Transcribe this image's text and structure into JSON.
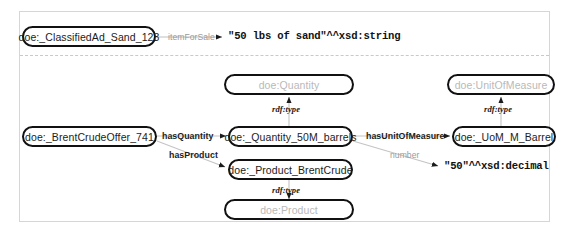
{
  "diagram": {
    "type": "rdf-graph",
    "nodes": {
      "classified_ad": "doe:_ClassifiedAd_Sand_123",
      "quantity_class": "doe:Quantity",
      "unit_of_measure_class": "doe:UnitOfMeasure",
      "brent_crude_offer": "doe:_BrentCrudeOffer_741",
      "quantity_instance": "doe:_Quantity_50M_barrels",
      "uom_instance": "doe:_UoM_M_Barrel",
      "product_instance": "doe:_Product_BrentCrude",
      "product_class": "doe:Product"
    },
    "literals": {
      "sand_string": "\"50 lbs of sand\"^^xsd:string",
      "decimal_50": "\"50\"^^xsd:decimal"
    },
    "edges": {
      "item_for_sale": "itemForSale",
      "has_quantity": "hasQuantity",
      "has_product": "hasProduct",
      "has_unit_of_measure": "hasUnitOfMeasure",
      "number": "number",
      "rdf_type_quantity": "rdf:type",
      "rdf_type_uom": "rdf:type",
      "rdf_type_product": "rdf:type"
    },
    "colors": {
      "node_border": "#111111",
      "instance_text": "#1c1c1c",
      "class_text": "#b9b9b9",
      "edge_label": "#9a9a9a",
      "edge_line": "#b5b5b5",
      "panel_border": "#d6d6d6"
    }
  }
}
